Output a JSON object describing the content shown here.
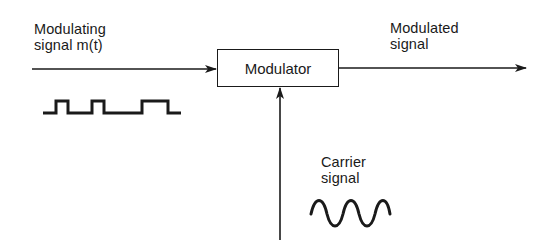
{
  "diagram": {
    "type": "block-diagram",
    "title": "",
    "blocks": [
      {
        "id": "modulator",
        "label": "Modulator"
      }
    ],
    "signals": {
      "input": {
        "line1": "Modulating",
        "line2": "signal m(t)",
        "waveform": "square-pulse-train"
      },
      "output": {
        "line1": "Modulated",
        "line2": "signal"
      },
      "carrier": {
        "line1": "Carrier",
        "line2": "signal",
        "waveform": "sinusoid"
      }
    },
    "edges": [
      {
        "from": "modulating-signal",
        "to": "modulator",
        "direction": "left-to-right"
      },
      {
        "from": "modulator",
        "to": "modulated-signal",
        "direction": "left-to-right"
      },
      {
        "from": "carrier-signal",
        "to": "modulator",
        "direction": "bottom-to-top"
      }
    ],
    "colors": {
      "ink": "#1a1a1a",
      "background": "#ffffff"
    }
  }
}
